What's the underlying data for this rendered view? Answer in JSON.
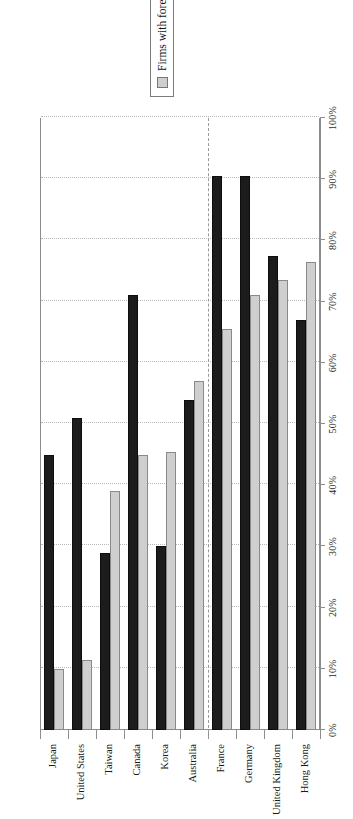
{
  "chart_data": {
    "type": "bar",
    "orientation": "vertical-rendered-rotated",
    "title": "",
    "subtitle": "",
    "xlabel": "",
    "ylabel": "",
    "ylim": [
      0,
      100
    ],
    "grid": true,
    "legend_position": "right",
    "categories": [
      "Japan",
      "United States",
      "Taiwan",
      "Canada",
      "Korea",
      "Australia",
      "France",
      "Germany",
      "United Kingdom",
      "Hong Kong"
    ],
    "tick_labels": [
      "0%",
      "10%",
      "20%",
      "30%",
      "40%",
      "50%",
      "60%",
      "70%",
      "80%",
      "90%",
      "100%"
    ],
    "tick_values": [
      0,
      10,
      20,
      30,
      40,
      50,
      60,
      70,
      80,
      90,
      100
    ],
    "series": [
      {
        "name": "Firms with foreign leads",
        "color": "#cfcfcf",
        "values": [
          10,
          11.5,
          39,
          45,
          45.5,
          57,
          65.5,
          71,
          73.5,
          76.5
        ]
      },
      {
        "name": "Firms with foreign sales",
        "color": "#1c1c1c",
        "values": [
          45,
          51,
          29,
          71,
          30,
          54,
          90.5,
          90.5,
          77.5,
          67
        ]
      }
    ],
    "group_separator_after_category": "Australia"
  },
  "legend": {
    "entries": [
      {
        "label": "Firms with foreign leads",
        "swatch": "leads"
      },
      {
        "label": "Firms with foreign sales",
        "swatch": "sales"
      }
    ]
  }
}
